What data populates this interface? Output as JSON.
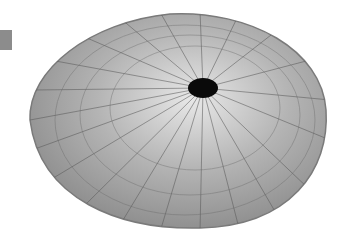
{
  "image": {
    "subject": "keyhole limpet shell",
    "colors": {
      "background": "#ffffff",
      "shell_base": "#a8a8a8",
      "ribs": "#5a5a5a",
      "hole": "#0a0a0a",
      "marker": "#8c8c8c"
    }
  }
}
